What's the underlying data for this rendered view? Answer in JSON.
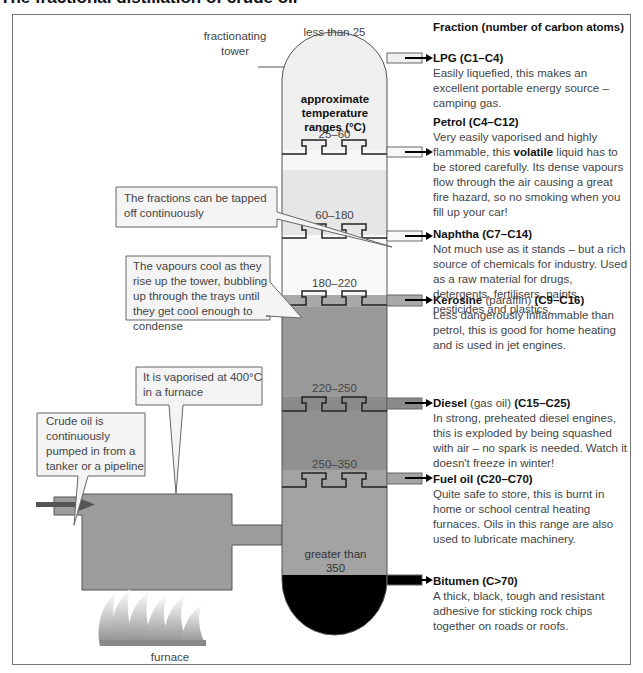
{
  "title": "The fractional distillation of crude oil",
  "column_header": "Fraction (number of carbon atoms)",
  "labels": {
    "fractionating_tower": "fractionating tower",
    "furnace": "furnace",
    "temperature_heading": "approximate temperature ranges (°C)"
  },
  "temperature_ranges": [
    {
      "label": "less than 25"
    },
    {
      "label": "25–60"
    },
    {
      "label": "60–180"
    },
    {
      "label": "180–220"
    },
    {
      "label": "220–250"
    },
    {
      "label": "250–350"
    },
    {
      "label": "greater than 350"
    }
  ],
  "callouts": {
    "tapped": "The fractions can be tapped off continuously",
    "vapours": "The vapours cool as they rise up the tower, bubbling up through the trays until they get cool enough to condense",
    "vaporised": "It is vaporised at 400°C in a furnace",
    "crude": "Crude oil is continuously pumped in from a tanker or a pipeline"
  },
  "fractions": [
    {
      "name": "LPG",
      "alt": "",
      "carbons": "(C1–C4)",
      "desc": "Easily liquefied, this makes an excellent portable energy source – camping gas."
    },
    {
      "name": "Petrol",
      "alt": "",
      "carbons": "(C4–C12)",
      "desc_pre": "Very easily vaporised and highly flammable, this ",
      "desc_bold": "volatile",
      "desc_post": " liquid has to be stored carefully. Its dense vapours flow through the air causing a great fire hazard, so no smoking when you fill up your car!"
    },
    {
      "name": "Naphtha",
      "alt": "",
      "carbons": "(C7–C14)",
      "desc": "Not much use as it stands – but a rich source of chemicals for industry. Used as a raw material for drugs, detergents, fertilisers, paints, pesticides and plastics."
    },
    {
      "name": "Kerosine",
      "alt": "(paraffin)",
      "carbons": "(C9–C16)",
      "desc": "Less dangerously inflammable than petrol, this is good for home heating and is used in jet engines."
    },
    {
      "name": "Diesel",
      "alt": "(gas oil)",
      "carbons": "(C15–C25)",
      "desc": "In strong, preheated diesel engines, this is exploded by being squashed with air – no spark is needed. Watch it doesn't freeze in winter!"
    },
    {
      "name": "Fuel oil",
      "alt": "",
      "carbons": "(C20–C70)",
      "desc": "Quite safe to store, this is burnt in home or school central heating furnaces. Oils in this range are also used to lubricate machinery."
    },
    {
      "name": "Bitumen",
      "alt": "",
      "carbons": "(C>70)",
      "desc": "A thick, black, tough and resistant adhesive for sticking rock chips together on roads or roofs."
    }
  ],
  "colors": {
    "tower_top": "#eeeeee",
    "band_light": "#f6f6f6",
    "band_mid": "#a9a9a9",
    "band_dark": "#8f8f8f",
    "furnace": "#999999",
    "bitumen": "#000000"
  }
}
